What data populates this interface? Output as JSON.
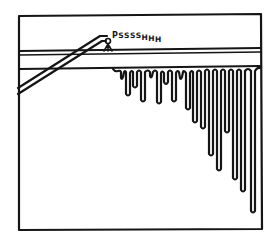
{
  "panel": {
    "sound_effect": "PSSSSHHH",
    "sound_effect_letters": [
      "P",
      "S",
      "S",
      "S",
      "S",
      "H",
      "H",
      "H"
    ],
    "ink_color": "#151515",
    "background_color": "#ffffff"
  },
  "scene": {
    "elements": [
      {
        "name": "panel-frame",
        "description": "rectangular comic panel border"
      },
      {
        "name": "ceiling-rail",
        "description": "horizontal double-line pipe/rail across the panel"
      },
      {
        "name": "spray-hose",
        "description": "diagonal tube from left edge up to nozzle"
      },
      {
        "name": "spray-nozzle",
        "description": "small nozzle spraying onto rail"
      },
      {
        "name": "drips",
        "description": "dripping liquid hanging from underside of rail, lengthening to the right"
      }
    ]
  }
}
